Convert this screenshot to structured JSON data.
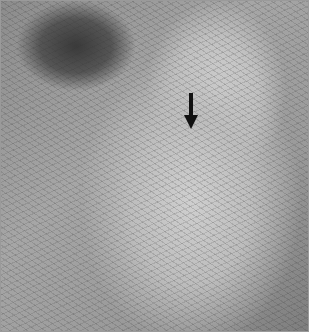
{
  "image": {
    "description": "Grayscale clinical photograph with a single black arrow annotation",
    "border_color": "#9a9a9a",
    "arrow": {
      "direction": "down",
      "color": "#111111"
    }
  }
}
